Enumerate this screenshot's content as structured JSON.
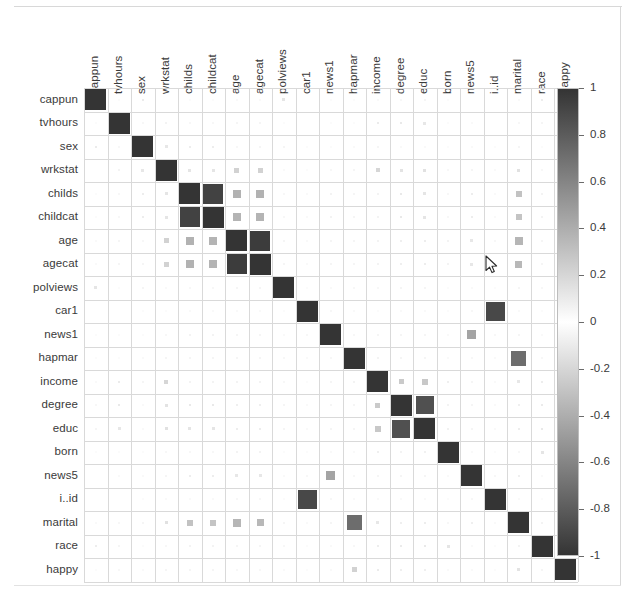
{
  "chart_data": {
    "type": "heatmap",
    "title": "",
    "subtitle": "",
    "xlabel": "",
    "ylabel": "",
    "grid": true,
    "legend_position": "right",
    "colormap": "grayscale-diverging",
    "colorbar": {
      "min": -1,
      "max": 1,
      "ticks": [
        1,
        0.8,
        0.6,
        0.4,
        0.2,
        0,
        -0.2,
        -0.4,
        -0.6,
        -0.8,
        -1
      ],
      "tick_labels": [
        "1",
        "0.8",
        "0.6",
        "0.4",
        "0.2",
        "0",
        "-0.2",
        "-0.4",
        "-0.6",
        "-0.8",
        "-1"
      ],
      "dark_color": "#343434",
      "mid_color": "#ffffff"
    },
    "variables": [
      "cappun",
      "tvhours",
      "sex",
      "wrkstat",
      "childs",
      "childcat",
      "age",
      "agecat",
      "polviews",
      "car1",
      "news1",
      "hapmar",
      "income",
      "degree",
      "educ",
      "born",
      "news5",
      "i..id",
      "marital",
      "race",
      "happy"
    ],
    "categories": [
      "cappun",
      "tvhours",
      "sex",
      "wrkstat",
      "childs",
      "childcat",
      "age",
      "agecat",
      "polviews",
      "car1",
      "news1",
      "hapmar",
      "income",
      "degree",
      "educ",
      "born",
      "news5",
      "i..id",
      "marital",
      "race",
      "happy"
    ],
    "row_labels": [
      "cappun",
      "tvhours",
      "sex",
      "wrkstat",
      "childs",
      "childcat",
      "age",
      "agecat",
      "polviews",
      "car1",
      "news1",
      "hapmar",
      "income",
      "degree",
      "educ",
      "born",
      "news5",
      "i..id",
      "marital",
      "race",
      "happy"
    ],
    "col_labels": [
      "cappun",
      "tvhours",
      "sex",
      "wrkstat",
      "childs",
      "childcat",
      "age",
      "agecat",
      "polviews",
      "car1",
      "news1",
      "hapmar",
      "income",
      "degree",
      "educ",
      "born",
      "news5",
      "i..id",
      "marital",
      "race",
      "happy"
    ],
    "matrix": [
      [
        1.0,
        0.02,
        0.1,
        0.01,
        0.02,
        0.02,
        0.03,
        0.03,
        0.13,
        0.01,
        0.02,
        0.02,
        0.03,
        0.04,
        0.05,
        0.02,
        0.01,
        0.01,
        0.03,
        0.09,
        0.02
      ],
      [
        0.02,
        1.0,
        0.04,
        0.06,
        0.04,
        0.04,
        0.05,
        0.05,
        0.02,
        0.01,
        0.02,
        0.02,
        0.1,
        0.11,
        0.12,
        0.02,
        0.03,
        0.01,
        0.04,
        0.05,
        0.04
      ],
      [
        0.1,
        0.04,
        1.0,
        0.12,
        0.09,
        0.09,
        0.04,
        0.05,
        0.05,
        0.02,
        0.02,
        0.03,
        0.05,
        0.03,
        0.03,
        0.02,
        0.03,
        0.02,
        0.05,
        0.02,
        0.03
      ],
      [
        0.01,
        0.06,
        0.12,
        1.0,
        0.13,
        0.13,
        0.22,
        0.22,
        0.03,
        0.02,
        0.04,
        0.05,
        0.2,
        0.14,
        0.15,
        0.04,
        0.05,
        0.03,
        0.15,
        0.04,
        0.05
      ],
      [
        0.02,
        0.04,
        0.09,
        0.13,
        1.0,
        0.93,
        0.38,
        0.38,
        0.04,
        0.03,
        0.06,
        0.05,
        0.06,
        0.11,
        0.13,
        0.04,
        0.09,
        0.03,
        0.3,
        0.06,
        0.05
      ],
      [
        0.02,
        0.04,
        0.09,
        0.13,
        0.93,
        1.0,
        0.37,
        0.37,
        0.04,
        0.03,
        0.06,
        0.05,
        0.06,
        0.11,
        0.13,
        0.04,
        0.09,
        0.03,
        0.29,
        0.06,
        0.05
      ],
      [
        0.03,
        0.05,
        0.04,
        0.22,
        0.38,
        0.37,
        1.0,
        0.96,
        0.05,
        0.03,
        0.05,
        0.05,
        0.06,
        0.08,
        0.09,
        0.06,
        0.12,
        0.04,
        0.36,
        0.05,
        0.04
      ],
      [
        0.03,
        0.05,
        0.05,
        0.22,
        0.38,
        0.37,
        0.96,
        1.0,
        0.05,
        0.03,
        0.05,
        0.05,
        0.06,
        0.08,
        0.09,
        0.06,
        0.12,
        0.04,
        0.35,
        0.05,
        0.04
      ],
      [
        0.13,
        0.02,
        0.05,
        0.03,
        0.04,
        0.04,
        0.05,
        0.05,
        1.0,
        0.02,
        0.03,
        0.04,
        0.04,
        0.05,
        0.05,
        0.02,
        0.03,
        0.02,
        0.05,
        0.04,
        0.03
      ],
      [
        0.01,
        0.01,
        0.02,
        0.02,
        0.03,
        0.03,
        0.03,
        0.03,
        0.02,
        1.0,
        0.04,
        0.03,
        0.02,
        0.03,
        0.03,
        0.02,
        0.04,
        0.9,
        0.03,
        0.02,
        0.02
      ],
      [
        0.02,
        0.02,
        0.02,
        0.04,
        0.06,
        0.06,
        0.05,
        0.05,
        0.03,
        0.04,
        1.0,
        0.04,
        0.05,
        0.05,
        0.05,
        0.03,
        0.45,
        0.04,
        0.05,
        0.03,
        0.03
      ],
      [
        0.02,
        0.02,
        0.03,
        0.05,
        0.05,
        0.05,
        0.05,
        0.05,
        0.04,
        0.03,
        0.04,
        1.0,
        0.06,
        0.05,
        0.05,
        0.03,
        0.04,
        0.03,
        0.72,
        0.04,
        0.22
      ],
      [
        0.03,
        0.1,
        0.05,
        0.2,
        0.06,
        0.06,
        0.06,
        0.06,
        0.04,
        0.02,
        0.05,
        0.06,
        1.0,
        0.26,
        0.27,
        0.08,
        0.05,
        0.03,
        0.12,
        0.09,
        0.1
      ],
      [
        0.04,
        0.11,
        0.03,
        0.14,
        0.11,
        0.11,
        0.08,
        0.08,
        0.05,
        0.03,
        0.05,
        0.05,
        0.26,
        1.0,
        0.86,
        0.06,
        0.05,
        0.03,
        0.08,
        0.1,
        0.08
      ],
      [
        0.05,
        0.12,
        0.03,
        0.15,
        0.13,
        0.13,
        0.09,
        0.09,
        0.05,
        0.03,
        0.05,
        0.05,
        0.27,
        0.86,
        1.0,
        0.07,
        0.05,
        0.03,
        0.09,
        0.11,
        0.08
      ],
      [
        0.02,
        0.02,
        0.02,
        0.04,
        0.04,
        0.04,
        0.06,
        0.06,
        0.02,
        0.02,
        0.03,
        0.03,
        0.08,
        0.06,
        0.07,
        1.0,
        0.03,
        0.02,
        0.04,
        0.13,
        0.03
      ],
      [
        0.01,
        0.03,
        0.03,
        0.05,
        0.09,
        0.09,
        0.12,
        0.12,
        0.03,
        0.04,
        0.45,
        0.04,
        0.05,
        0.05,
        0.05,
        0.03,
        1.0,
        0.04,
        0.08,
        0.03,
        0.03
      ],
      [
        0.01,
        0.01,
        0.02,
        0.03,
        0.03,
        0.03,
        0.04,
        0.04,
        0.02,
        0.9,
        0.04,
        0.03,
        0.03,
        0.03,
        0.03,
        0.02,
        0.04,
        1.0,
        0.03,
        0.02,
        0.02
      ],
      [
        0.03,
        0.04,
        0.05,
        0.15,
        0.3,
        0.29,
        0.36,
        0.35,
        0.05,
        0.03,
        0.05,
        0.72,
        0.12,
        0.08,
        0.09,
        0.04,
        0.08,
        0.03,
        1.0,
        0.06,
        0.14
      ],
      [
        0.09,
        0.05,
        0.02,
        0.04,
        0.06,
        0.06,
        0.05,
        0.05,
        0.04,
        0.02,
        0.03,
        0.04,
        0.09,
        0.1,
        0.11,
        0.13,
        0.03,
        0.02,
        0.06,
        1.0,
        0.05
      ],
      [
        0.02,
        0.04,
        0.03,
        0.05,
        0.05,
        0.05,
        0.04,
        0.04,
        0.03,
        0.02,
        0.03,
        0.22,
        0.1,
        0.08,
        0.08,
        0.03,
        0.03,
        0.02,
        0.14,
        0.05,
        1.0
      ]
    ]
  },
  "layout": {
    "grid_left": 84,
    "grid_top": 88,
    "cell_size": 23.5,
    "n": 21,
    "colorbar_left": 557,
    "colorbar_top": 88,
    "colorbar_width": 22,
    "colorbar_height": 468
  },
  "cursor": {
    "name": "mouse-pointer",
    "x": 485,
    "y": 255
  }
}
